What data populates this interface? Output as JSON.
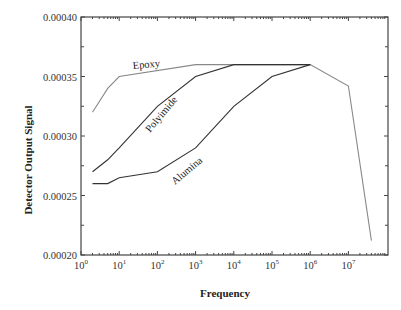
{
  "chart_data": {
    "type": "line",
    "title": "",
    "xlabel": "Frequency",
    "ylabel": "Detector Output Signal",
    "xscale": "log",
    "xlim": [
      1,
      100000000
    ],
    "ylim": [
      0.0002,
      0.0004
    ],
    "x_tick_labels": [
      "10^0",
      "10^1",
      "10^2",
      "10^3",
      "10^4",
      "10^5",
      "10^6",
      "10^7"
    ],
    "y_tick_labels": [
      "0.00020",
      "0.00025",
      "0.00030",
      "0.00035",
      "0.00040"
    ],
    "grid": false,
    "legend": "inline labels",
    "series": [
      {
        "name": "Epoxy",
        "color": "#888888",
        "x": [
          2,
          5,
          10,
          1000,
          1000000,
          10000000,
          40000000
        ],
        "y": [
          0.00032,
          0.00034,
          0.00035,
          0.00036,
          0.00036,
          0.000342,
          0.000212
        ]
      },
      {
        "name": "Polyimide",
        "color": "#333333",
        "x": [
          2,
          5,
          10,
          100,
          1000,
          10000,
          1000000
        ],
        "y": [
          0.00027,
          0.00028,
          0.00029,
          0.000325,
          0.00035,
          0.00036,
          0.00036
        ]
      },
      {
        "name": "Alumina",
        "color": "#333333",
        "x": [
          2,
          5,
          10,
          100,
          1000,
          10000,
          100000,
          1000000
        ],
        "y": [
          0.00026,
          0.00026,
          0.000265,
          0.00027,
          0.00029,
          0.000325,
          0.00035,
          0.00036
        ]
      }
    ]
  }
}
